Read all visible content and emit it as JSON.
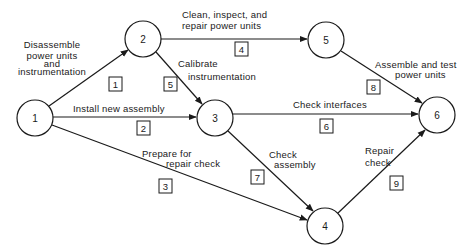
{
  "diagram": {
    "type": "activity-on-arrow network",
    "nodes": [
      {
        "id": "1",
        "label": "1",
        "cx": 35,
        "cy": 118
      },
      {
        "id": "2",
        "label": "2",
        "cx": 143,
        "cy": 39
      },
      {
        "id": "3",
        "label": "3",
        "cx": 215,
        "cy": 118
      },
      {
        "id": "4",
        "label": "4",
        "cx": 325,
        "cy": 226
      },
      {
        "id": "5",
        "label": "5",
        "cx": 326,
        "cy": 40
      },
      {
        "id": "6",
        "label": "6",
        "cx": 437,
        "cy": 115
      }
    ],
    "node_radius": 18,
    "activities": [
      {
        "number": "1",
        "from": "1",
        "to": "2",
        "description_lines": [
          "Disassemble",
          "power units",
          "and",
          "instrumentation"
        ]
      },
      {
        "number": "2",
        "from": "1",
        "to": "3",
        "description_lines": [
          "Install new assembly"
        ]
      },
      {
        "number": "3",
        "from": "1",
        "to": "4",
        "description_lines": [
          "Prepare for",
          "repair check"
        ]
      },
      {
        "number": "4",
        "from": "2",
        "to": "5",
        "description_lines": [
          "Clean, inspect, and",
          "repair power units"
        ]
      },
      {
        "number": "5",
        "from": "2",
        "to": "3",
        "description_lines": [
          "Calibrate",
          "instrumentation"
        ]
      },
      {
        "number": "6",
        "from": "3",
        "to": "6",
        "description_lines": [
          "Check interfaces"
        ]
      },
      {
        "number": "7",
        "from": "3",
        "to": "4",
        "description_lines": [
          "Check",
          "assembly"
        ]
      },
      {
        "number": "8",
        "from": "5",
        "to": "6",
        "description_lines": [
          "Assemble and test",
          "power units"
        ]
      },
      {
        "number": "9",
        "from": "4",
        "to": "6",
        "description_lines": [
          "Repair",
          "check"
        ]
      }
    ]
  },
  "labels": {
    "n1": "1",
    "n2": "2",
    "n3": "3",
    "n4": "4",
    "n5": "5",
    "n6": "6",
    "a1_l1": "Disassemble",
    "a1_l2": "power units",
    "a1_l3": "and",
    "a1_l4": "instrumentation",
    "a2_l1": "Install new assembly",
    "a3_l1": "Prepare for",
    "a3_l2": "repair check",
    "a4_l1": "Clean, inspect, and",
    "a4_l2": "repair power units",
    "a5_l1": "Calibrate",
    "a5_l2": "instrumentation",
    "a6_l1": "Check interfaces",
    "a7_l1": "Check",
    "a7_l2": "assembly",
    "a8_l1": "Assemble and test",
    "a8_l2": "power units",
    "a9_l1": "Repair",
    "a9_l2": "check",
    "b1": "1",
    "b2": "2",
    "b3": "3",
    "b4": "4",
    "b5": "5",
    "b6": "6",
    "b7": "7",
    "b8": "8",
    "b9": "9"
  },
  "colors": {
    "stroke": "#1a1a1a",
    "background": "#ffffff"
  }
}
